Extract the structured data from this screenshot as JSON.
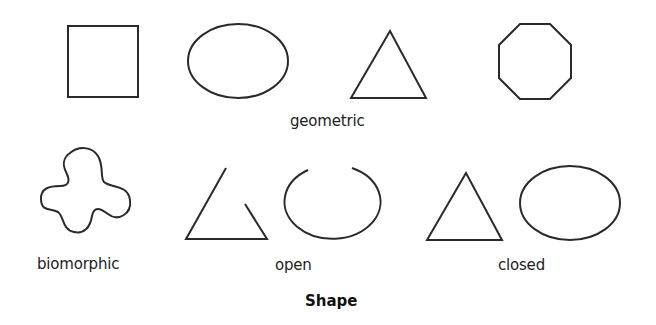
{
  "title": "Shape",
  "groups": {
    "geometric": {
      "label": "geometric",
      "shapes": [
        "square",
        "ellipse",
        "triangle",
        "octagon"
      ]
    },
    "biomorphic": {
      "label": "biomorphic",
      "shapes": [
        "biomorphic-blob"
      ]
    },
    "open": {
      "label": "open",
      "shapes": [
        "open-triangle",
        "open-ellipse"
      ]
    },
    "closed": {
      "label": "closed",
      "shapes": [
        "closed-triangle",
        "closed-ellipse"
      ]
    }
  },
  "colors": {
    "stroke": "#2a2a2a",
    "text": "#222222",
    "background": "#ffffff"
  }
}
